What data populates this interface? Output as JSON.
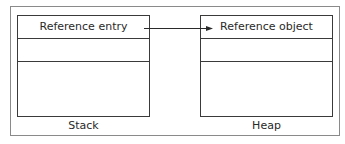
{
  "diagram": {
    "stack": {
      "label": "Stack",
      "rows": [
        "Reference entry",
        "",
        ""
      ]
    },
    "heap": {
      "label": "Heap",
      "rows": [
        "Reference object",
        "",
        ""
      ]
    },
    "arrow": {
      "from": "Reference entry",
      "to": "Reference object"
    }
  }
}
